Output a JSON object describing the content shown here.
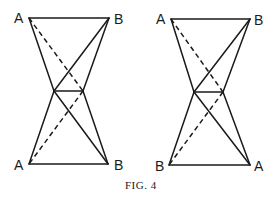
{
  "figure": {
    "caption": "Fig. 4",
    "caption_display": "FIG. 4"
  },
  "left_figure": {
    "labels": {
      "top_left": "A",
      "top_right": "B",
      "bottom_left": "A",
      "bottom_right": "B"
    }
  },
  "right_figure": {
    "labels": {
      "top_left": "A",
      "top_right": "B",
      "bottom_left": "B",
      "bottom_right": "A"
    }
  },
  "colors": {
    "stroke": "#1a1a1a",
    "background": "#ffffff"
  }
}
